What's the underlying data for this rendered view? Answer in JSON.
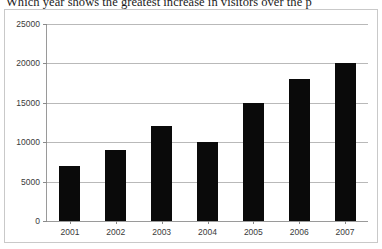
{
  "question": {
    "text": "Which year shows the greatest increase in visitors over the p"
  },
  "chart_data": {
    "type": "bar",
    "title": "",
    "xlabel": "",
    "ylabel": "",
    "categories": [
      "2001",
      "2002",
      "2003",
      "2004",
      "2005",
      "2006",
      "2007"
    ],
    "values": [
      7000,
      9000,
      12000,
      10000,
      15000,
      18000,
      20000
    ],
    "ylim": [
      0,
      25000
    ],
    "ytick_values": [
      0,
      5000,
      10000,
      15000,
      20000,
      25000
    ],
    "ytick_labels": [
      "0",
      "5000",
      "10000",
      "15000",
      "20000",
      "25000"
    ],
    "grid": true,
    "legend": false,
    "bar_color": "#0a0a0a",
    "grid_color": "#b9b9b9",
    "axis_color": "#9a9a9a"
  }
}
